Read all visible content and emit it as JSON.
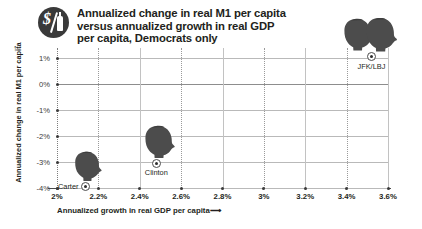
{
  "title": {
    "text": "Annualized change in real M1 per capita\nversus annualized growth in real GDP\nper capita, Democrats only",
    "badge_icon": "money-badge-icon"
  },
  "chart_data": {
    "type": "scatter",
    "title": "Annualized change in real M1 per capita versus annualized growth in real GDP per capita, Democrats only",
    "xlabel": "Annualized growth in real GDP per capita",
    "ylabel": "Annualized change in real M1 per capita",
    "xlim": [
      2.0,
      3.6
    ],
    "ylim": [
      -4.0,
      1.0
    ],
    "x_unit": "%",
    "y_unit": "%",
    "xticks": [
      2.0,
      2.2,
      2.4,
      2.6,
      2.8,
      3.0,
      3.2,
      3.4,
      3.6
    ],
    "xtick_labels": [
      "2%",
      "2.2%",
      "2.4%",
      "2.6%",
      "2.8%",
      "3%",
      "3.2%",
      "3.4%",
      "3.6%"
    ],
    "yticks": [
      1,
      0,
      -1,
      -2,
      -3,
      -4
    ],
    "ytick_labels": [
      "1%",
      "0%",
      "-1%",
      "-2%",
      "-3%",
      "-4%"
    ],
    "grid": true,
    "legend": "none",
    "points": [
      {
        "label": "Carter",
        "x": 2.14,
        "y": -3.95,
        "label_side": "left"
      },
      {
        "label": "Clinton",
        "x": 2.48,
        "y": -3.05,
        "label_side": "below"
      },
      {
        "label": "JFK/LBJ",
        "x": 3.52,
        "y": 1.05,
        "label_side": "below"
      }
    ]
  },
  "axis": {
    "x_arrow": "⟶",
    "y_arrow": "↑"
  }
}
